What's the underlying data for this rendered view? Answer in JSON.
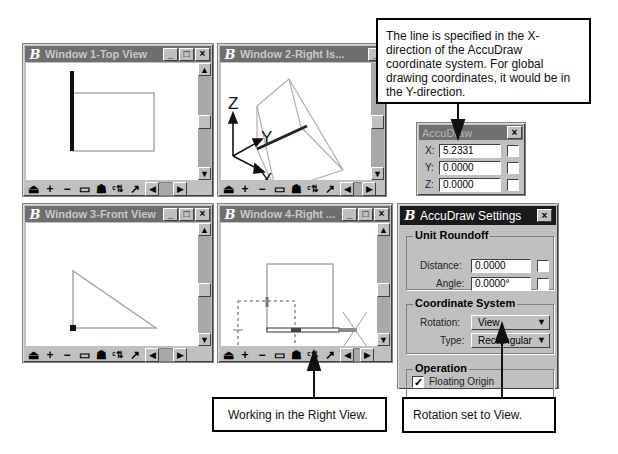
{
  "windows": [
    {
      "title": "Window 1-Top View",
      "buttons": [
        "_",
        "□",
        "×"
      ]
    },
    {
      "title": "Window 2-Right Is...",
      "buttons": [
        "_"
      ]
    },
    {
      "title": "Window 3-Front View",
      "buttons": [
        "_",
        "□",
        "×"
      ]
    },
    {
      "title": "Window 4-Right ...",
      "buttons": [
        "_",
        "□",
        "×"
      ]
    }
  ],
  "view_toolbar": {
    "tools": [
      "update-view",
      "zoom-in",
      "zoom-out",
      "window-area",
      "fit-view",
      "rotate-view",
      "pan-view"
    ]
  },
  "axes": {
    "z": "Z",
    "y": "Y",
    "x": "X"
  },
  "accudraw": {
    "title": "AccuDraw",
    "close": "×",
    "fields": [
      {
        "label": "X:",
        "value": "5.2331"
      },
      {
        "label": "Y:",
        "value": "0.0000"
      },
      {
        "label": "Z:",
        "value": "0.0000"
      }
    ]
  },
  "settings": {
    "title": "AccuDraw Settings",
    "close": "×",
    "unit_roundoff": {
      "label": "Unit Roundoff",
      "distance_label": "Distance:",
      "distance_value": "0.0000",
      "angle_label": "Angle:",
      "angle_value": "0.0000°"
    },
    "coordinate_system": {
      "label": "Coordinate System",
      "rotation_label": "Rotation:",
      "rotation_value": "View",
      "type_label": "Type:",
      "type_value": "Rectangular"
    },
    "operation": {
      "label": "Operation",
      "floating_origin_label": "Floating Origin",
      "floating_origin_checked": true
    }
  },
  "callouts": {
    "top": "The line is specified in the X-direction of the AccuDraw coordinate system. For global drawing coordinates, it would be in the Y-direction.",
    "working": "Working in the Right View.",
    "rotation": "Rotation set to View."
  },
  "icons": {
    "minimize": "_",
    "maximize": "□",
    "close": "×",
    "up": "▲",
    "down": "▼",
    "left": "◀",
    "right": "▶",
    "check": "✓",
    "logo": "B"
  }
}
